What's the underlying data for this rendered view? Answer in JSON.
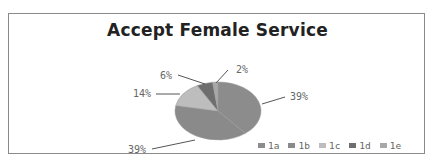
{
  "chart_data": {
    "type": "pie",
    "title": "Accept Female Service",
    "categories": [
      "1a",
      "1b",
      "1c",
      "1d",
      "1e"
    ],
    "values": [
      39,
      39,
      14,
      6,
      2
    ],
    "labels": [
      "39%",
      "39%",
      "14%",
      "6%",
      "2%"
    ],
    "colors": [
      "#8c8c8c",
      "#8a8a8a",
      "#bdbdbd",
      "#6e6e6e",
      "#a8a8a8"
    ],
    "legend_position": "bottom-right"
  },
  "legend": [
    {
      "label": "1a",
      "color": "#8c8c8c"
    },
    {
      "label": "1b",
      "color": "#8a8a8a"
    },
    {
      "label": "1c",
      "color": "#bdbdbd"
    },
    {
      "label": "1d",
      "color": "#6e6e6e"
    },
    {
      "label": "1e",
      "color": "#a8a8a8"
    }
  ]
}
